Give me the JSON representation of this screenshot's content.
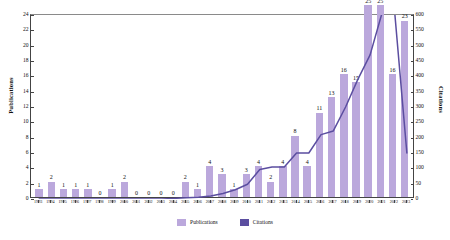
{
  "chart_data": {
    "type": "bar",
    "title": "",
    "xlabel": "",
    "ylabel": "Publications",
    "y2label": "Citations",
    "grid": false,
    "legend_position": "bottom-center",
    "ylim": [
      0,
      24
    ],
    "y2lim": [
      0,
      600
    ],
    "yticks": [
      0,
      2,
      4,
      6,
      8,
      10,
      12,
      14,
      16,
      18,
      20,
      22,
      24
    ],
    "y2ticks": [
      0,
      50,
      100,
      150,
      200,
      250,
      300,
      350,
      400,
      450,
      500,
      550,
      600
    ],
    "categories": [
      "1993",
      "1994",
      "1995",
      "1996",
      "1997",
      "1998",
      "1999",
      "2000",
      "2001",
      "2002",
      "2003",
      "2004",
      "2005",
      "2006",
      "2007",
      "2008",
      "2009",
      "2010",
      "2011",
      "2012",
      "2013",
      "2014",
      "2015",
      "2016",
      "2017",
      "2018",
      "2019",
      "2020",
      "2021",
      "2022",
      "2023"
    ],
    "series": [
      {
        "name": "Publications",
        "axis": "left",
        "kind": "bar",
        "color": "#bba8dc",
        "values": [
          1,
          2,
          1,
          1,
          1,
          0,
          1,
          2,
          0,
          0,
          0,
          0,
          2,
          1,
          4,
          3,
          1,
          3,
          4,
          2,
          4,
          8,
          4,
          11,
          13,
          16,
          15,
          25,
          25,
          16,
          23
        ],
        "labels": [
          "1",
          "2",
          "1",
          "1",
          "1",
          "0",
          "1",
          "2",
          "0",
          "0",
          "0",
          "0",
          "2",
          "1",
          "4",
          "3",
          "1",
          "3",
          "4",
          "2",
          "4",
          "8",
          "4",
          "11",
          "13",
          "16",
          "15",
          "25",
          "25",
          "16",
          "23"
        ]
      },
      {
        "name": "Citations",
        "axis": "right",
        "kind": "line",
        "color": "#5b4ea0",
        "values": [
          0,
          0,
          0,
          0,
          0,
          0,
          0,
          0,
          0,
          0,
          0,
          2,
          4,
          6,
          10,
          18,
          30,
          48,
          96,
          104,
          104,
          150,
          150,
          210,
          222,
          300,
          390,
          470,
          610,
          612,
          150
        ]
      }
    ]
  },
  "legend": {
    "items": [
      {
        "label": "Publications",
        "color": "#bba8dc"
      },
      {
        "label": "Citations",
        "color": "#5b4ea0"
      }
    ]
  }
}
